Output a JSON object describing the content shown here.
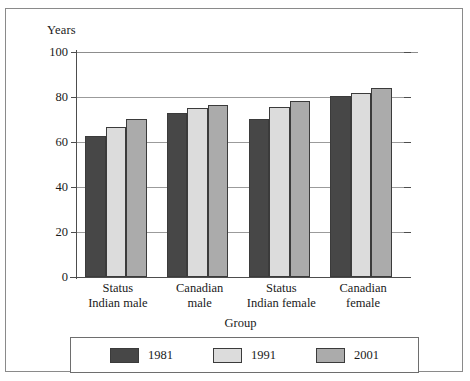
{
  "chart_data": {
    "type": "bar",
    "title": "",
    "xlabel": "Group",
    "ylabel": "Years",
    "ylim": [
      0,
      100
    ],
    "yticks": [
      0,
      20,
      40,
      60,
      80,
      100
    ],
    "grid": true,
    "legend_position": "bottom",
    "categories": [
      "Status Indian male",
      "Canadian male",
      "Status Indian female",
      "Canadian female"
    ],
    "category_lines": [
      [
        "Status",
        "Indian male"
      ],
      [
        "Canadian",
        "male"
      ],
      [
        "Status",
        "Indian female"
      ],
      [
        "Canadian",
        "female"
      ]
    ],
    "series": [
      {
        "name": "1981",
        "color": "#474747",
        "values": [
          62.7,
          73.0,
          70.2,
          80.4
        ]
      },
      {
        "name": "1991",
        "color": "#dcdcdc",
        "values": [
          66.6,
          75.0,
          75.6,
          82.0
        ]
      },
      {
        "name": "2001",
        "color": "#ababab",
        "values": [
          70.4,
          76.3,
          78.2,
          83.8
        ]
      }
    ]
  },
  "axis": {
    "y_title": "Years",
    "x_title": "Group",
    "y_tick_labels": [
      "100",
      "80",
      "60",
      "40",
      "20",
      "0"
    ]
  },
  "legend": {
    "entries": [
      {
        "label": "1981",
        "color": "#474747"
      },
      {
        "label": "1991",
        "color": "#dcdcdc"
      },
      {
        "label": "2001",
        "color": "#ababab"
      }
    ]
  },
  "colors": {
    "series_1981": "#474747",
    "series_1991": "#dcdcdc",
    "series_2001": "#ababab",
    "gridline": "#9b9b9b",
    "axis": "#4d4d4d",
    "frame": "#8a8a8a",
    "background": "#ffffff"
  }
}
